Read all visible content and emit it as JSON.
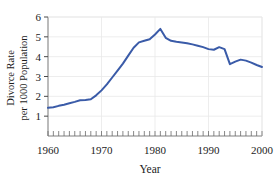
{
  "chart_data": {
    "type": "line",
    "title": "",
    "subtitle": "",
    "xlabel": "Year",
    "ylabel": "Divorce Rate per 1000 Population",
    "ylabel_line1": "Divorce Rate",
    "ylabel_line2": "per 1000 Population",
    "xlim": [
      1960,
      2000
    ],
    "ylim": [
      0,
      6
    ],
    "xticks": [
      1960,
      1970,
      1980,
      1990,
      2000
    ],
    "xtick_labels": [
      "1960",
      "1970",
      "1980",
      "1990",
      "2000"
    ],
    "yticks": [
      1,
      2,
      3,
      4,
      5,
      6
    ],
    "ytick_labels": [
      "1",
      "2",
      "3",
      "4",
      "5",
      "6"
    ],
    "minor_xtick_interval": 1,
    "grid": true,
    "grid_axis": "both",
    "legend": false,
    "legend_position": "none",
    "line_color": "#3A5BA8",
    "line_width": 2,
    "marker": "none",
    "x": [
      1960,
      1961,
      1962,
      1963,
      1964,
      1965,
      1966,
      1967,
      1968,
      1969,
      1970,
      1971,
      1972,
      1973,
      1974,
      1975,
      1976,
      1977,
      1978,
      1979,
      1980,
      1981,
      1982,
      1983,
      1984,
      1985,
      1986,
      1987,
      1988,
      1989,
      1990,
      1991,
      1992,
      1993,
      1994,
      1995,
      1996,
      1997,
      1998,
      1999,
      2000
    ],
    "values": [
      1.42,
      1.45,
      1.52,
      1.58,
      1.65,
      1.72,
      1.8,
      1.82,
      1.85,
      2.05,
      2.3,
      2.6,
      2.95,
      3.3,
      3.65,
      4.05,
      4.45,
      4.72,
      4.8,
      4.88,
      5.12,
      5.4,
      4.95,
      4.8,
      4.75,
      4.72,
      4.68,
      4.62,
      4.55,
      4.48,
      4.38,
      4.35,
      4.48,
      4.38,
      3.62,
      3.75,
      3.85,
      3.8,
      3.7,
      3.58,
      3.48
    ],
    "axis_frame": "box",
    "background": "#ffffff",
    "grid_color": "#e8e8e8",
    "axis_color": "#808080"
  },
  "figure": {
    "caption": ""
  }
}
